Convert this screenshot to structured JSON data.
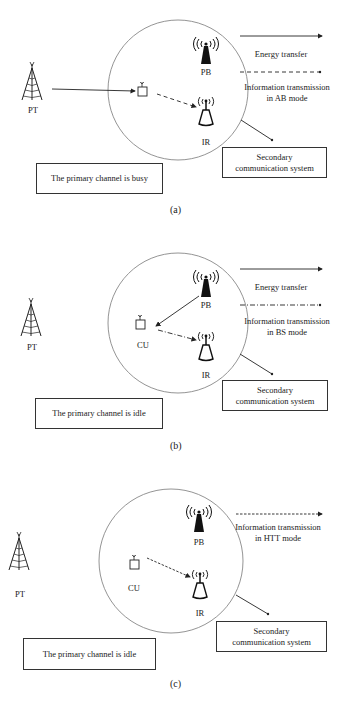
{
  "figure": {
    "panels": [
      {
        "id": "a",
        "caption": "(a)",
        "labels": {
          "pt": "PT",
          "cu": "",
          "pb": "PB",
          "ir": "IR"
        },
        "legend": [
          {
            "style": "solid",
            "label": "Energy transfer"
          },
          {
            "style": "dashed",
            "label_line1": "Information transmission",
            "label_line2": "in AB mode"
          }
        ],
        "status_box": "The primary channel is busy",
        "system_box": {
          "line1": "Secondary",
          "line2": "communication system"
        },
        "links": [
          {
            "from": "PT",
            "to": "CU",
            "style": "solid"
          },
          {
            "from": "CU",
            "to": "IR",
            "style": "dashed"
          }
        ]
      },
      {
        "id": "b",
        "caption": "(b)",
        "labels": {
          "pt": "PT",
          "cu": "CU",
          "pb": "PB",
          "ir": "IR"
        },
        "legend": [
          {
            "style": "solid",
            "label": "Energy transfer"
          },
          {
            "style": "dash-dot",
            "label_line1": "Information transmission",
            "label_line2": "in BS mode"
          }
        ],
        "status_box": "The primary channel is idle",
        "system_box": {
          "line1": "Secondary",
          "line2": "communication system"
        },
        "links": [
          {
            "from": "PB",
            "to": "CU",
            "style": "solid"
          },
          {
            "from": "CU",
            "to": "IR",
            "style": "dash-dot"
          }
        ]
      },
      {
        "id": "c",
        "caption": "(c)",
        "labels": {
          "pt": "PT",
          "cu": "CU",
          "pb": "PB",
          "ir": "IR"
        },
        "legend": [
          {
            "style": "dotted-dash",
            "label_line1": "Information transmission",
            "label_line2": "in HTT mode"
          }
        ],
        "status_box": "The primary channel is idle",
        "system_box": {
          "line1": "Secondary",
          "line2": "communication system"
        },
        "links": [
          {
            "from": "CU",
            "to": "IR",
            "style": "short-dash"
          }
        ]
      }
    ],
    "colors": {
      "line": "#333333",
      "circle": "#888888",
      "icon": "#111111",
      "background": "#ffffff"
    }
  }
}
